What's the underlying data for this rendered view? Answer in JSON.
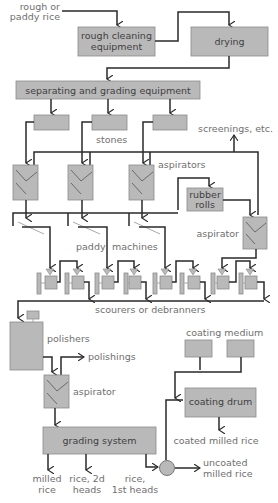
{
  "diagram": {
    "type": "process-flow",
    "inputs": {
      "rough_rice": [
        "rough or",
        "paddy rice"
      ]
    },
    "boxes": {
      "rough_cleaning": [
        "rough cleaning",
        "equipment"
      ],
      "drying": "drying",
      "separating": "separating and grading equipment",
      "rubber_rolls": [
        "rubber",
        "rolls"
      ],
      "coating_drum": "coating drum",
      "grading_system": "grading system"
    },
    "labels": {
      "stones": "stones",
      "screenings": "screenings, etc.",
      "aspirators": "aspirators",
      "aspirator_right": "aspirator",
      "paddy": "paddy",
      "machines": "machines",
      "scourers": "scourers or debranners",
      "polishers": "polishers",
      "polishings": "polishings",
      "aspirator_lower": "aspirator",
      "coating_medium": "coating medium",
      "coated_milled_rice": "coated milled rice",
      "uncoated": [
        "uncoated",
        "milled rice"
      ],
      "milled_rice": [
        "milled",
        "rice"
      ],
      "rice_2d_heads": [
        "rice, 2d",
        "heads"
      ],
      "rice_1st_heads": [
        "rice,",
        "1st heads"
      ]
    },
    "colors": {
      "box_fill": "#b9b9b9",
      "line": "#2a2a2a",
      "label_text": "#6f6f6f"
    }
  }
}
